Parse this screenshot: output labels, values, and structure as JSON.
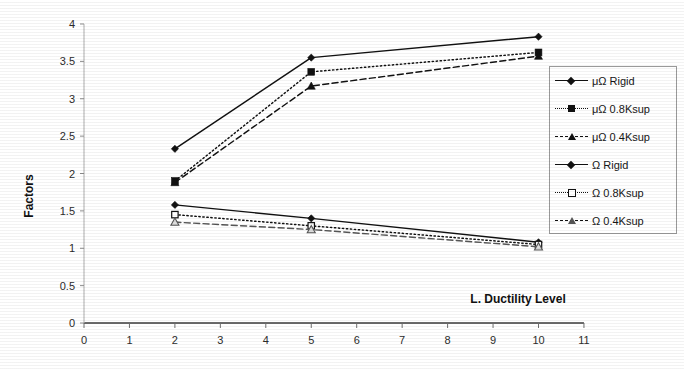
{
  "chart_data": {
    "type": "line",
    "title": "",
    "xlabel": "L. Ductility Level",
    "ylabel": "Factors",
    "xlim": [
      0,
      11
    ],
    "ylim": [
      0,
      4
    ],
    "xticks": [
      "0",
      "1",
      "2",
      "3",
      "4",
      "5",
      "6",
      "7",
      "8",
      "9",
      "10",
      "11"
    ],
    "yticks": [
      "0",
      "0.5",
      "1",
      "1.5",
      "2",
      "2.5",
      "3",
      "3.5",
      "4"
    ],
    "grid": false,
    "legend_position": "right",
    "x": [
      2,
      5,
      10
    ],
    "series": [
      {
        "name": "μΩ Rigid",
        "values": [
          2.33,
          3.55,
          3.83
        ],
        "line_style": "solid",
        "marker": "diamond",
        "color": "#111111"
      },
      {
        "name": "μΩ 0.8Ksup",
        "values": [
          1.9,
          3.36,
          3.62
        ],
        "line_style": "dotted",
        "marker": "square",
        "color": "#111111"
      },
      {
        "name": "μΩ 0.4Ksup",
        "values": [
          1.88,
          3.17,
          3.57
        ],
        "line_style": "dashed",
        "marker": "triangle",
        "color": "#111111"
      },
      {
        "name": "Ω Rigid",
        "values": [
          1.58,
          1.4,
          1.08
        ],
        "line_style": "solid",
        "marker": "diamond",
        "color": "#111111"
      },
      {
        "name": "Ω 0.8Ksup",
        "values": [
          1.45,
          1.3,
          1.05
        ],
        "line_style": "dotted",
        "marker": "square-open",
        "color": "#111111"
      },
      {
        "name": "Ω 0.4Ksup",
        "values": [
          1.35,
          1.25,
          1.02
        ],
        "line_style": "dashed",
        "marker": "triangle-open",
        "color": "#555555"
      }
    ]
  },
  "legend": {
    "items": [
      {
        "label": "μΩ Rigid"
      },
      {
        "label": "μΩ 0.8Ksup"
      },
      {
        "label": "μΩ 0.4Ksup"
      },
      {
        "label": "Ω Rigid"
      },
      {
        "label": "Ω 0.8Ksup"
      },
      {
        "label": "Ω 0.4Ksup"
      }
    ]
  }
}
